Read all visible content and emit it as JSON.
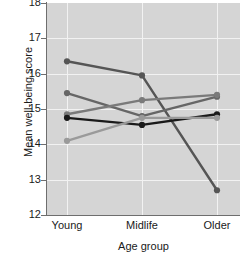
{
  "chart_data": {
    "type": "line",
    "title": "",
    "xlabel": "Age group",
    "ylabel": "Mean well-being score",
    "categories": [
      "Young",
      "Midlife",
      "Older"
    ],
    "x": [
      0,
      1,
      2
    ],
    "ylim": [
      12,
      18
    ],
    "yticks": [
      12,
      13,
      14,
      15,
      16,
      17,
      18
    ],
    "ytick_labels": [
      "12",
      "13",
      "14",
      "15",
      "16",
      "17",
      "18"
    ],
    "grid": true,
    "legend": "none",
    "markers": "filled-circle",
    "plot_background": "#d5d5d5",
    "gridline_color": "#f2f2f2",
    "series": [
      {
        "name": "series-1",
        "color": "#555555",
        "values": [
          16.35,
          15.95,
          12.7
        ]
      },
      {
        "name": "series-2",
        "color": "#666666",
        "values": [
          15.45,
          14.8,
          15.35
        ]
      },
      {
        "name": "series-3",
        "color": "#7a7a7a",
        "values": [
          14.85,
          15.25,
          15.4
        ]
      },
      {
        "name": "series-4",
        "color": "#1a1a1a",
        "values": [
          14.75,
          14.55,
          14.85
        ]
      },
      {
        "name": "series-5",
        "color": "#9a9a9a",
        "values": [
          14.1,
          14.75,
          14.75
        ]
      }
    ]
  },
  "axes": {
    "y_tick_0": "12",
    "y_tick_1": "13",
    "y_tick_2": "14",
    "y_tick_3": "15",
    "y_tick_4": "16",
    "y_tick_5": "17",
    "y_tick_6": "18",
    "x_tick_0": "Young",
    "x_tick_1": "Midlife",
    "x_tick_2": "Older",
    "y_axis_title": "Mean well-being score",
    "x_axis_title": "Age group"
  }
}
